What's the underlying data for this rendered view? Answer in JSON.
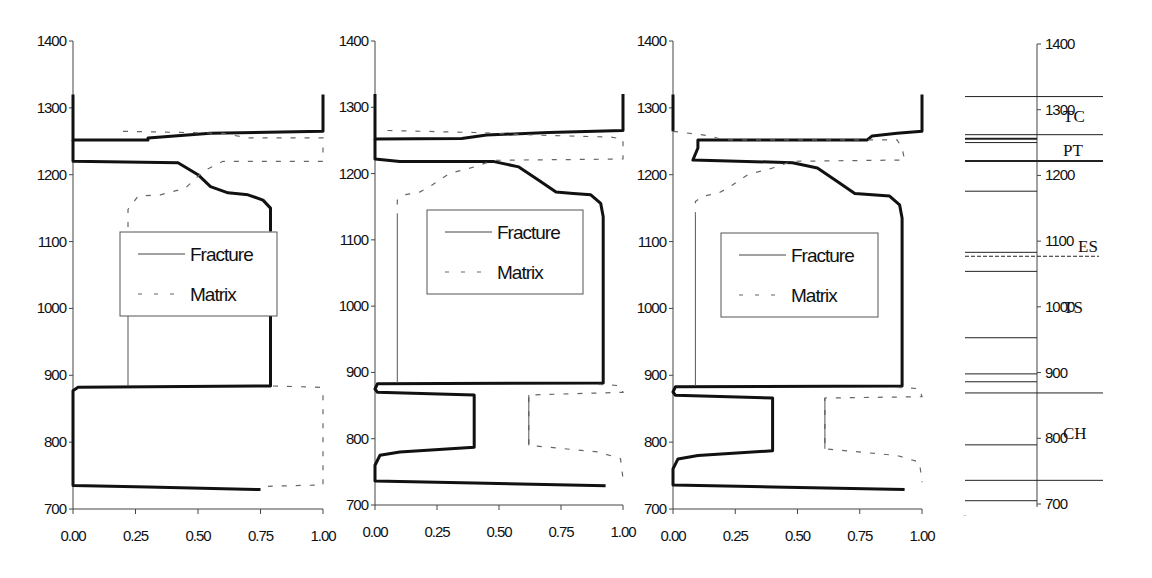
{
  "figure": {
    "caption_visible": false
  },
  "chart_data": [
    {
      "type": "line",
      "panel": 1,
      "title": "",
      "xlabel": "",
      "ylabel": "",
      "xlim": [
        0,
        1
      ],
      "ylim": [
        700,
        1400
      ],
      "xticks": [
        "0.00",
        "0.25",
        "0.50",
        "0.75",
        "1.00"
      ],
      "yticks": [
        "700",
        "800",
        "900",
        "1000",
        "1100",
        "1200",
        "1300",
        "1400"
      ],
      "grid": false,
      "legend": {
        "entries": [
          "Fracture",
          "Matrix"
        ],
        "position": "inside-center"
      },
      "pixel": {
        "x0": 73,
        "x1": 323,
        "y700": 509,
        "y1400": 41
      },
      "legend_box": {
        "x": 120,
        "y": 232,
        "w": 157,
        "h": 84
      },
      "series": [
        {
          "name": "Fracture",
          "style": "solid-thick",
          "points": [
            [
              0.0,
              1320
            ],
            [
              0.0,
              1265
            ],
            [
              0.0,
              1252
            ],
            [
              0.3,
              1252
            ],
            [
              0.3,
              1255
            ],
            [
              0.55,
              1262
            ],
            [
              1.0,
              1265
            ],
            [
              1.0,
              1320
            ]
          ]
        },
        {
          "name": "Fracture",
          "style": "solid-thick",
          "points": [
            [
              0.0,
              1252
            ],
            [
              0.0,
              1220
            ],
            [
              0.42,
              1218
            ],
            [
              0.5,
              1200
            ],
            [
              0.55,
              1182
            ],
            [
              0.62,
              1173
            ],
            [
              0.7,
              1170
            ],
            [
              0.76,
              1162
            ],
            [
              0.79,
              1150
            ],
            [
              0.79,
              1115
            ]
          ]
        },
        {
          "name": "Fracture",
          "style": "solid-thick",
          "points": [
            [
              0.79,
              1000
            ],
            [
              0.79,
              884
            ],
            [
              0.02,
              882
            ],
            [
              0.0,
              877
            ],
            [
              0.0,
              735
            ],
            [
              0.3,
              733
            ],
            [
              0.75,
              729
            ]
          ]
        },
        {
          "name": "Matrix",
          "style": "dashed",
          "points": [
            [
              0.2,
              1265
            ],
            [
              0.6,
              1262
            ],
            [
              0.7,
              1255
            ],
            [
              1.0,
              1255
            ],
            [
              1.0,
              1220
            ],
            [
              0.6,
              1220
            ],
            [
              0.52,
              1205
            ],
            [
              0.45,
              1180
            ],
            [
              0.35,
              1170
            ],
            [
              0.26,
              1168
            ],
            [
              0.22,
              1148
            ],
            [
              0.22,
              1115
            ]
          ]
        },
        {
          "name": "Matrix",
          "style": "solid-thin",
          "points": [
            [
              0.22,
              1000
            ],
            [
              0.22,
              884
            ]
          ]
        },
        {
          "name": "Matrix",
          "style": "dashed",
          "points": [
            [
              0.8,
              884
            ],
            [
              0.99,
              882
            ],
            [
              1.0,
              875
            ],
            [
              1.0,
              740
            ],
            [
              1.0,
              736
            ],
            [
              0.78,
              734
            ]
          ]
        }
      ]
    },
    {
      "type": "line",
      "panel": 2,
      "title": "",
      "xlabel": "",
      "ylabel": "",
      "xlim": [
        0,
        1
      ],
      "ylim": [
        700,
        1400
      ],
      "xticks": [
        "0.00",
        "0.25",
        "0.50",
        "0.75",
        "1.00"
      ],
      "yticks": [
        "700",
        "800",
        "900",
        "1000",
        "1100",
        "1200",
        "1300",
        "1400"
      ],
      "grid": false,
      "legend": {
        "entries": [
          "Fracture",
          "Matrix"
        ],
        "position": "inside-center"
      },
      "pixel": {
        "x0": 375,
        "x1": 623,
        "y700": 505,
        "y1400": 41
      },
      "legend_box": {
        "x": 427,
        "y": 210,
        "w": 156,
        "h": 84
      },
      "series": [
        {
          "name": "Fracture",
          "style": "solid-thick",
          "points": [
            [
              0.0,
              1320
            ],
            [
              0.0,
              1265
            ],
            [
              0.0,
              1252
            ],
            [
              0.35,
              1253
            ],
            [
              0.45,
              1258
            ],
            [
              0.7,
              1262
            ],
            [
              1.0,
              1265
            ],
            [
              1.0,
              1320
            ]
          ]
        },
        {
          "name": "Fracture",
          "style": "solid-thick",
          "points": [
            [
              0.0,
              1252
            ],
            [
              0.0,
              1222
            ],
            [
              0.1,
              1218
            ],
            [
              0.48,
              1218
            ],
            [
              0.58,
              1210
            ],
            [
              0.66,
              1190
            ],
            [
              0.73,
              1172
            ],
            [
              0.8,
              1170
            ],
            [
              0.87,
              1168
            ],
            [
              0.91,
              1155
            ],
            [
              0.92,
              1135
            ],
            [
              0.92,
              884
            ],
            [
              0.01,
              883
            ],
            [
              0.0,
              875
            ],
            [
              0.01,
              870
            ],
            [
              0.4,
              866
            ],
            [
              0.4,
              787
            ],
            [
              0.1,
              780
            ],
            [
              0.02,
              775
            ],
            [
              0.0,
              760
            ],
            [
              0.0,
              736
            ],
            [
              0.4,
              733
            ],
            [
              0.93,
              729
            ]
          ]
        },
        {
          "name": "Matrix",
          "style": "dashed",
          "points": [
            [
              0.05,
              1265
            ],
            [
              0.4,
              1262
            ],
            [
              0.65,
              1258
            ],
            [
              0.95,
              1255
            ],
            [
              1.0,
              1252
            ],
            [
              1.0,
              1222
            ],
            [
              0.48,
              1220
            ],
            [
              0.4,
              1210
            ],
            [
              0.3,
              1200
            ],
            [
              0.22,
              1180
            ],
            [
              0.18,
              1172
            ],
            [
              0.12,
              1168
            ],
            [
              0.09,
              1160
            ],
            [
              0.09,
              1140
            ]
          ]
        },
        {
          "name": "Matrix",
          "style": "solid-thin",
          "points": [
            [
              0.09,
              1140
            ],
            [
              0.09,
              884
            ]
          ]
        },
        {
          "name": "Matrix",
          "style": "dashed",
          "points": [
            [
              0.9,
              882
            ],
            [
              0.99,
              880
            ],
            [
              1.0,
              870
            ],
            [
              0.62,
              866
            ],
            [
              0.62,
              790
            ],
            [
              0.9,
              780
            ],
            [
              0.99,
              770
            ],
            [
              1.0,
              740
            ]
          ]
        },
        {
          "name": "Matrix",
          "style": "solid-thin",
          "points": [
            [
              0.62,
              866
            ],
            [
              0.62,
              790
            ]
          ]
        }
      ]
    },
    {
      "type": "line",
      "panel": 3,
      "title": "",
      "xlabel": "",
      "ylabel": "",
      "xlim": [
        0,
        1
      ],
      "ylim": [
        700,
        1400
      ],
      "xticks": [
        "0.00",
        "0.25",
        "0.50",
        "0.75",
        "1.00"
      ],
      "yticks": [
        "700",
        "800",
        "900",
        "1000",
        "1100",
        "1200",
        "1300",
        "1400"
      ],
      "grid": false,
      "legend": {
        "entries": [
          "Fracture",
          "Matrix"
        ],
        "position": "inside-center"
      },
      "pixel": {
        "x0": 673,
        "x1": 922,
        "y700": 509,
        "y1400": 41
      },
      "legend_box": {
        "x": 721,
        "y": 233,
        "w": 157,
        "h": 84
      },
      "series": [
        {
          "name": "Fracture",
          "style": "solid-thick",
          "points": [
            [
              0.0,
              1320
            ],
            [
              0.0,
              1265
            ]
          ]
        },
        {
          "name": "Fracture",
          "style": "solid-thick",
          "points": [
            [
              1.0,
              1320
            ],
            [
              1.0,
              1265
            ],
            [
              0.9,
              1262
            ],
            [
              0.8,
              1258
            ],
            [
              0.78,
              1252
            ],
            [
              0.1,
              1252
            ],
            [
              0.1,
              1240
            ],
            [
              0.08,
              1222
            ],
            [
              0.48,
              1218
            ],
            [
              0.58,
              1210
            ],
            [
              0.66,
              1190
            ],
            [
              0.73,
              1172
            ],
            [
              0.8,
              1170
            ],
            [
              0.87,
              1168
            ],
            [
              0.91,
              1155
            ],
            [
              0.92,
              1135
            ],
            [
              0.92,
              884
            ],
            [
              0.01,
              883
            ],
            [
              0.0,
              875
            ],
            [
              0.01,
              870
            ],
            [
              0.4,
              866
            ],
            [
              0.4,
              787
            ],
            [
              0.1,
              780
            ],
            [
              0.02,
              775
            ],
            [
              0.0,
              760
            ],
            [
              0.0,
              736
            ],
            [
              0.4,
              733
            ],
            [
              0.93,
              729
            ]
          ]
        },
        {
          "name": "Matrix",
          "style": "dashed",
          "points": [
            [
              0.0,
              1265
            ],
            [
              0.15,
              1258
            ],
            [
              0.2,
              1252
            ],
            [
              0.9,
              1252
            ],
            [
              0.92,
              1240
            ],
            [
              0.93,
              1222
            ],
            [
              0.48,
              1220
            ],
            [
              0.4,
              1210
            ],
            [
              0.3,
              1200
            ],
            [
              0.22,
              1180
            ],
            [
              0.18,
              1172
            ],
            [
              0.12,
              1168
            ],
            [
              0.09,
              1160
            ],
            [
              0.09,
              1140
            ]
          ]
        },
        {
          "name": "Matrix",
          "style": "solid-thin",
          "points": [
            [
              0.09,
              1140
            ],
            [
              0.09,
              884
            ]
          ]
        },
        {
          "name": "Matrix",
          "style": "dashed",
          "points": [
            [
              0.9,
              882
            ],
            [
              0.99,
              880
            ],
            [
              1.0,
              868
            ],
            [
              0.61,
              866
            ],
            [
              0.61,
              790
            ],
            [
              0.9,
              780
            ],
            [
              0.99,
              770
            ],
            [
              1.0,
              740
            ]
          ]
        },
        {
          "name": "Matrix",
          "style": "solid-thin",
          "points": [
            [
              0.61,
              866
            ],
            [
              0.61,
              790
            ]
          ]
        }
      ]
    },
    {
      "type": "stratigraphic-column",
      "panel": 4,
      "ylim": [
        700,
        1400
      ],
      "yticks": [
        "700",
        "800",
        "900",
        "1000",
        "1100",
        "1200",
        "1300",
        "1400"
      ],
      "pixel": {
        "axis_x": 1037,
        "left_x": 965,
        "right_x": 1103,
        "y700": 504,
        "y1400": 44
      },
      "boundaries": [
        {
          "depth": 1320,
          "extent": "full",
          "style": "solid"
        },
        {
          "depth": 1262,
          "extent": "full",
          "style": "solid"
        },
        {
          "depth": 1256,
          "extent": "left",
          "style": "thick"
        },
        {
          "depth": 1250,
          "extent": "left",
          "style": "solid"
        },
        {
          "depth": 1222,
          "extent": "full",
          "style": "thick"
        },
        {
          "depth": 1176,
          "extent": "left",
          "style": "solid"
        },
        {
          "depth": 1083,
          "extent": "left",
          "style": "solid"
        },
        {
          "depth": 1077,
          "extent": "full",
          "style": "dashed"
        },
        {
          "depth": 1054,
          "extent": "left",
          "style": "solid"
        },
        {
          "depth": 953,
          "extent": "left",
          "style": "solid"
        },
        {
          "depth": 898,
          "extent": "left",
          "style": "solid"
        },
        {
          "depth": 886,
          "extent": "left",
          "style": "solid"
        },
        {
          "depth": 869,
          "extent": "full",
          "style": "solid"
        },
        {
          "depth": 790,
          "extent": "left",
          "style": "solid"
        },
        {
          "depth": 736,
          "extent": "full",
          "style": "solid"
        },
        {
          "depth": 705,
          "extent": "left",
          "style": "solid"
        }
      ],
      "units": [
        {
          "label": "TC",
          "depth": 1290,
          "x": 1063
        },
        {
          "label": "PT",
          "depth": 1238,
          "x": 1063
        },
        {
          "label": "ES",
          "depth": 1092,
          "x": 1078
        },
        {
          "label": "TS",
          "depth": 1000,
          "x": 1063
        },
        {
          "label": "CH",
          "depth": 808,
          "x": 1063
        }
      ]
    }
  ]
}
